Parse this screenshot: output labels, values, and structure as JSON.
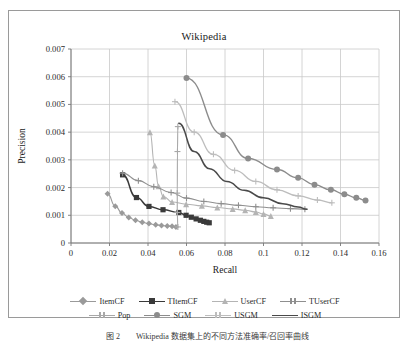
{
  "figure": {
    "caption": "图 2　　Wikipedia 数据集上的不同方法准确率/召回率曲线"
  },
  "chart_data": {
    "type": "line",
    "title": "Wikipedia",
    "xlabel": "Recall",
    "ylabel": "Precision",
    "xlim": [
      0,
      0.16
    ],
    "ylim": [
      0,
      0.007
    ],
    "xticks": [
      "0",
      "0.02",
      "0.04",
      "0.06",
      "0.08",
      "0.1",
      "0.12",
      "0.14",
      "0.16"
    ],
    "xtick_values": [
      0,
      0.02,
      0.04,
      0.06,
      0.08,
      0.1,
      0.12,
      0.14,
      0.16
    ],
    "yticks": [
      "0",
      "0.001",
      "0.002",
      "0.003",
      "0.004",
      "0.005",
      "0.006",
      "0.007"
    ],
    "ytick_values": [
      0,
      0.001,
      0.002,
      0.003,
      0.004,
      0.005,
      0.006,
      0.007
    ],
    "grid": true,
    "legend_position": "bottom",
    "series": [
      {
        "name": "ItemCF",
        "color": "#9a9a9a",
        "marker": "diamond",
        "width": 1.1,
        "points": [
          [
            0.019,
            0.00178
          ],
          [
            0.023,
            0.00133
          ],
          [
            0.0265,
            0.00108
          ],
          [
            0.03,
            0.00092
          ],
          [
            0.0335,
            0.00082
          ],
          [
            0.037,
            0.00075
          ],
          [
            0.0405,
            0.0007
          ],
          [
            0.044,
            0.00066
          ],
          [
            0.047,
            0.00063
          ],
          [
            0.05,
            0.00061
          ],
          [
            0.0525,
            0.0006
          ],
          [
            0.0545,
            0.00058
          ]
        ]
      },
      {
        "name": "TItemCF",
        "color": "#3a3a3a",
        "marker": "square",
        "width": 1.5,
        "points": [
          [
            0.0268,
            0.00246
          ],
          [
            0.034,
            0.00164
          ],
          [
            0.0405,
            0.00132
          ],
          [
            0.0478,
            0.0012
          ],
          [
            0.056,
            0.0011
          ],
          [
            0.0598,
            0.001
          ],
          [
            0.0625,
            0.00093
          ],
          [
            0.065,
            0.00087
          ],
          [
            0.0672,
            0.00082
          ],
          [
            0.069,
            0.00078
          ],
          [
            0.0705,
            0.00075
          ],
          [
            0.0718,
            0.00073
          ]
        ]
      },
      {
        "name": "UserCF",
        "color": "#b4b4b4",
        "marker": "triangle",
        "width": 1.1,
        "points": [
          [
            0.041,
            0.004
          ],
          [
            0.0435,
            0.0028
          ],
          [
            0.0455,
            0.00205
          ],
          [
            0.048,
            0.00168
          ],
          [
            0.0525,
            0.00148
          ],
          [
            0.0598,
            0.0014
          ],
          [
            0.068,
            0.00134
          ],
          [
            0.076,
            0.00128
          ],
          [
            0.084,
            0.00123
          ],
          [
            0.0905,
            0.00118
          ],
          [
            0.096,
            0.00112
          ],
          [
            0.1,
            0.00105
          ],
          [
            0.1038,
            0.00097
          ]
        ]
      },
      {
        "name": "TUserCF",
        "color": "#8f8f8f",
        "marker": "plus",
        "width": 1.1,
        "points": [
          [
            0.0268,
            0.00252
          ],
          [
            0.035,
            0.00225
          ],
          [
            0.043,
            0.00203
          ],
          [
            0.052,
            0.00182
          ],
          [
            0.06,
            0.00162
          ],
          [
            0.069,
            0.0015
          ],
          [
            0.078,
            0.00142
          ],
          [
            0.087,
            0.00136
          ],
          [
            0.096,
            0.00131
          ],
          [
            0.105,
            0.00127
          ],
          [
            0.114,
            0.00124
          ],
          [
            0.1215,
            0.00122
          ]
        ]
      },
      {
        "name": "Pop",
        "color": "#a8a8a8",
        "marker": "plus",
        "width": 1.1,
        "points": [
          [
            0.0555,
            0.00058
          ],
          [
            0.0552,
            0.0011
          ],
          [
            0.0552,
            0.0018
          ],
          [
            0.0553,
            0.0033
          ],
          [
            0.0555,
            0.0042
          ]
        ]
      },
      {
        "name": "SGM",
        "color": "#8c8c8c",
        "marker": "circle",
        "width": 1.4,
        "points": [
          [
            0.06,
            0.00595
          ],
          [
            0.079,
            0.0039
          ],
          [
            0.092,
            0.00305
          ],
          [
            0.107,
            0.00265
          ],
          [
            0.118,
            0.00235
          ],
          [
            0.1265,
            0.0021
          ],
          [
            0.135,
            0.00192
          ],
          [
            0.142,
            0.00176
          ],
          [
            0.1482,
            0.00163
          ],
          [
            0.153,
            0.00153
          ]
        ]
      },
      {
        "name": "USGM",
        "color": "#bdbdbd",
        "marker": "plus",
        "width": 1.3,
        "points": [
          [
            0.054,
            0.0051
          ],
          [
            0.064,
            0.004
          ],
          [
            0.074,
            0.0032
          ],
          [
            0.085,
            0.00262
          ],
          [
            0.096,
            0.00222
          ],
          [
            0.107,
            0.00192
          ],
          [
            0.118,
            0.0017
          ],
          [
            0.128,
            0.00155
          ],
          [
            0.1355,
            0.00145
          ]
        ]
      },
      {
        "name": "ISGM",
        "color": "#4a4a4a",
        "marker": "none",
        "width": 1.5,
        "points": [
          [
            0.056,
            0.00432
          ],
          [
            0.064,
            0.0033
          ],
          [
            0.072,
            0.00268
          ],
          [
            0.081,
            0.00222
          ],
          [
            0.09,
            0.0019
          ],
          [
            0.1,
            0.00163
          ],
          [
            0.11,
            0.00142
          ],
          [
            0.118,
            0.0013
          ],
          [
            0.1225,
            0.00122
          ]
        ]
      }
    ]
  }
}
